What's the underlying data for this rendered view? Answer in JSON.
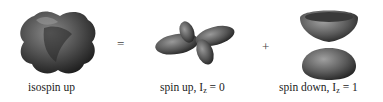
{
  "figure": {
    "terms": [
      {
        "id": "isospin-up",
        "label": "isospin up",
        "shape": "cuboid-lobed-blob"
      },
      {
        "id": "spin-up",
        "label_main": "spin up, I",
        "label_sub": "z",
        "label_tail": " = 0",
        "shape": "four-lobed-cloverleaf"
      },
      {
        "id": "spin-down",
        "label_main": "spin down, I",
        "label_sub": "z",
        "label_tail": " = 1",
        "shape": "torus-over-lobe"
      }
    ],
    "operators": {
      "equals": "=",
      "plus": "+"
    }
  }
}
